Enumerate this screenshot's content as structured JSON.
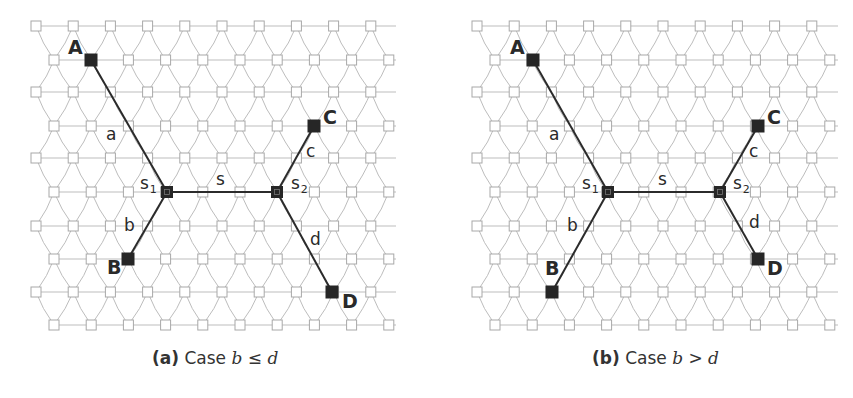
{
  "colors": {
    "grid_line": "#bdbdbd",
    "grid_node_stroke": "#a8a8a8",
    "grid_node_fill": "#ffffff",
    "path_line": "#2b2b2b",
    "terminal_fill": "#262626",
    "label": "#2a2a2a"
  },
  "lattice": {
    "row_y": [
      26,
      60,
      92,
      126,
      158,
      192,
      226,
      259,
      292,
      325
    ],
    "spacing": 37.2,
    "node_size": 10,
    "nodes_per_row": 10
  },
  "panels": [
    {
      "id": "a",
      "caption": {
        "tag": "(a)",
        "word": "Case",
        "var1": "b",
        "op": "≤",
        "var2": "d",
        "x": 152
      },
      "lattice_origin": {
        "even_x0": 36,
        "odd_x0": 54,
        "line_end": 396
      },
      "terminals": [
        {
          "name": "A",
          "x": 91,
          "y": 60,
          "label_x": 68,
          "label_y": 54
        },
        {
          "name": "B",
          "x": 128,
          "y": 259,
          "label_x": 107,
          "label_y": 274
        },
        {
          "name": "C",
          "x": 314,
          "y": 126,
          "label_x": 323,
          "label_y": 124
        },
        {
          "name": "D",
          "x": 332,
          "y": 292,
          "label_x": 342,
          "label_y": 308
        }
      ],
      "steiner": [
        {
          "name": "s",
          "sub": "1",
          "x": 167,
          "y": 192,
          "label_x": 140,
          "label_y": 189
        },
        {
          "name": "s",
          "sub": "2",
          "x": 277,
          "y": 192,
          "label_x": 291,
          "label_y": 189
        }
      ],
      "edges": [
        {
          "from": [
            91,
            60
          ],
          "to": [
            167,
            192
          ],
          "label": "a",
          "lx": 106,
          "ly": 140
        },
        {
          "from": [
            128,
            259
          ],
          "to": [
            167,
            192
          ],
          "label": "b",
          "lx": 124,
          "ly": 231
        },
        {
          "from": [
            167,
            192
          ],
          "to": [
            277,
            192
          ],
          "label": "s",
          "lx": 216,
          "ly": 185
        },
        {
          "from": [
            277,
            192
          ],
          "to": [
            314,
            126
          ],
          "label": "c",
          "lx": 306,
          "ly": 157
        },
        {
          "from": [
            277,
            192
          ],
          "to": [
            332,
            292
          ],
          "label": "d",
          "lx": 310,
          "ly": 245
        }
      ]
    },
    {
      "id": "b",
      "caption": {
        "tag": "(b)",
        "word": "Case",
        "var1": "b",
        "op": ">",
        "var2": "d",
        "x": 592
      },
      "lattice_origin": {
        "even_x0": 477,
        "odd_x0": 495,
        "line_end": 838
      },
      "terminals": [
        {
          "name": "A",
          "x": 533,
          "y": 60,
          "label_x": 510,
          "label_y": 54
        },
        {
          "name": "B",
          "x": 552,
          "y": 292,
          "label_x": 545,
          "label_y": 275
        },
        {
          "name": "C",
          "x": 758,
          "y": 126,
          "label_x": 767,
          "label_y": 124
        },
        {
          "name": "D",
          "x": 758,
          "y": 259,
          "label_x": 767,
          "label_y": 275
        }
      ],
      "steiner": [
        {
          "name": "s",
          "sub": "1",
          "x": 608,
          "y": 192,
          "label_x": 582,
          "label_y": 189
        },
        {
          "name": "s",
          "sub": "2",
          "x": 720,
          "y": 192,
          "label_x": 733,
          "label_y": 189
        }
      ],
      "edges": [
        {
          "from": [
            533,
            60
          ],
          "to": [
            608,
            192
          ],
          "label": "a",
          "lx": 549,
          "ly": 140
        },
        {
          "from": [
            552,
            292
          ],
          "to": [
            608,
            192
          ],
          "label": "b",
          "lx": 567,
          "ly": 231
        },
        {
          "from": [
            608,
            192
          ],
          "to": [
            720,
            192
          ],
          "label": "s",
          "lx": 658,
          "ly": 185
        },
        {
          "from": [
            720,
            192
          ],
          "to": [
            758,
            126
          ],
          "label": "c",
          "lx": 749,
          "ly": 157
        },
        {
          "from": [
            720,
            192
          ],
          "to": [
            758,
            259
          ],
          "label": "d",
          "lx": 749,
          "ly": 228
        }
      ]
    }
  ]
}
